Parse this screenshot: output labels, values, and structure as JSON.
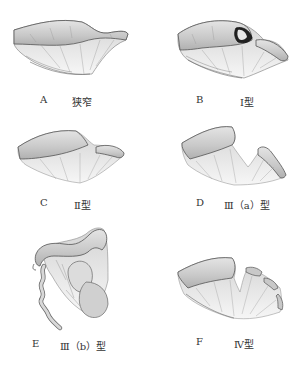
{
  "figure": {
    "panels": [
      {
        "id": "A",
        "letter": "A",
        "caption": "狭窄"
      },
      {
        "id": "B",
        "letter": "B",
        "caption": "Ⅰ型"
      },
      {
        "id": "C",
        "letter": "C",
        "caption": "Ⅱ型"
      },
      {
        "id": "D",
        "letter": "D",
        "caption": "Ⅲ（a）型"
      },
      {
        "id": "E",
        "letter": "E",
        "caption": "Ⅲ（b）型"
      },
      {
        "id": "F",
        "letter": "F",
        "caption": "Ⅳ型"
      }
    ],
    "colors": {
      "bowel_fill": "#d9d9d9",
      "bowel_dark": "#a8a8a8",
      "outline": "#555555",
      "mesentery": "#e6e6e6",
      "text": "#333333"
    }
  }
}
